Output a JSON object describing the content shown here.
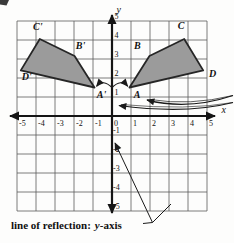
{
  "figure": {
    "axis": {
      "x_label": "x",
      "y_label": "y",
      "x_ticks": [
        "-5",
        "-4",
        "-3",
        "-2",
        "-1",
        "0",
        "1",
        "2",
        "3",
        "4",
        "5"
      ],
      "y_ticks_positive": [
        "5",
        "4",
        "3",
        "2",
        "1"
      ],
      "y_ticks_negative": [
        "-1",
        "-2",
        "-3",
        "-4",
        "-5"
      ],
      "x_range": [
        -5,
        5
      ],
      "y_range": [
        -5,
        5
      ]
    },
    "shapes": [
      {
        "name": "preimage-ABCD",
        "vertices": [
          {
            "label": "A",
            "x": 0.92,
            "y": 1.5
          },
          {
            "label": "B",
            "x": 1.97,
            "y": 3.16
          },
          {
            "label": "C",
            "x": 3.8,
            "y": 4.05
          },
          {
            "label": "D",
            "x": 4.8,
            "y": 2.4
          }
        ]
      },
      {
        "name": "image-A'B'C'D'",
        "vertices": [
          {
            "label": "A'",
            "x": -0.92,
            "y": 1.5
          },
          {
            "label": "B'",
            "x": -1.97,
            "y": 3.16
          },
          {
            "label": "C'",
            "x": -3.8,
            "y": 4.05
          },
          {
            "label": "D'",
            "x": -4.8,
            "y": 2.4
          }
        ]
      }
    ],
    "caption": {
      "prefix": "line of reflection:",
      "term_italic": "y",
      "term_rest": "-axis"
    }
  },
  "colors": {
    "shape_fill": "#9b9b9b",
    "shape_stroke": "#262626",
    "grid_line": "#5a5a5a",
    "axis": "#151515",
    "annotation": "#1a1a1a",
    "text": "#111111"
  }
}
